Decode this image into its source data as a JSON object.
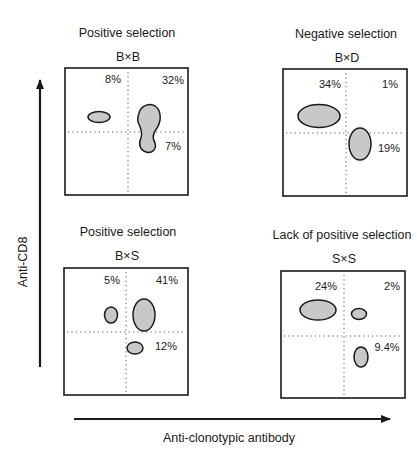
{
  "axes": {
    "y_label": "Anti-CD8",
    "x_label": "Anti-clonotypic antibody"
  },
  "panels": [
    {
      "title": "Positive selection",
      "cross": "B×B",
      "labels": {
        "upper_left": "8%",
        "upper_right": "32%",
        "lower_right": "7%"
      }
    },
    {
      "title": "Negative selection",
      "cross": "B×D",
      "labels": {
        "upper_left": "34%",
        "upper_right": "1%",
        "lower_right": "19%"
      }
    },
    {
      "title": "Positive selection",
      "cross": "B×S",
      "labels": {
        "upper_left": "5%",
        "upper_right": "41%",
        "lower_right": "12%"
      }
    },
    {
      "title": "Lack of positive selection",
      "cross": "S×S",
      "labels": {
        "upper_left": "24%",
        "upper_right": "2%",
        "lower_right": "9.4%"
      }
    }
  ],
  "colors": {
    "population_fill": "#c8c8c8",
    "outline": "#1a1a1a"
  }
}
